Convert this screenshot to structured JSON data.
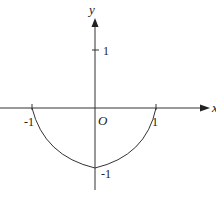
{
  "diagram": {
    "axes": {
      "x_label": "x",
      "y_label": "y",
      "origin_label": "O"
    },
    "ticks": {
      "x_neg": "-1",
      "x_pos": "1",
      "y_pos": "1",
      "y_neg": "-1"
    },
    "curve": {
      "description": "Two curved arcs joining (-1,0) to (0,-1) and (0,-1) to (1,0), meeting at a cusp at (0,-1)",
      "points": [
        [
          -1,
          0
        ],
        [
          0,
          -1
        ],
        [
          1,
          0
        ]
      ]
    },
    "colors": {
      "stroke": "#333333",
      "background": "#ffffff"
    }
  }
}
